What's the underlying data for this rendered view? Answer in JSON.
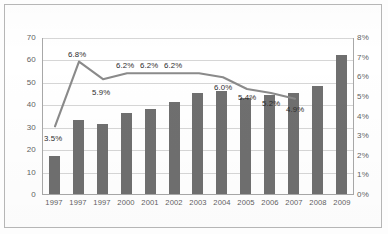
{
  "chart_data": {
    "type": "bar",
    "title": "",
    "subtitle": "",
    "xlabel": "",
    "ylabel": "",
    "grid": true,
    "legend_position": "none",
    "categories": [
      "1997",
      "1997",
      "1997",
      "2000",
      "2001",
      "2002",
      "2003",
      "2004",
      "2005",
      "2006",
      "2007",
      "2008",
      "2009"
    ],
    "series": [
      {
        "name": "bars",
        "chart_type": "bar",
        "axis": "left",
        "color": "#6f6f6f",
        "values": [
          17,
          33,
          31,
          36,
          38,
          41,
          45,
          46,
          43,
          44,
          45,
          48,
          62
        ]
      },
      {
        "name": "percent-line",
        "chart_type": "line",
        "axis": "right",
        "color": "#8a8a8a",
        "values": [
          3.5,
          6.8,
          5.9,
          6.2,
          6.2,
          6.2,
          6.2,
          6.0,
          5.4,
          5.2,
          4.9,
          null,
          null
        ],
        "point_labels": [
          "3.5%",
          "6.8%",
          "5.9%",
          "6.2%",
          "6.2%",
          "6.2%",
          "",
          "6.0%",
          "5.4%",
          "5.2%",
          "4.9%",
          "",
          ""
        ]
      }
    ],
    "left_axis": {
      "min": 0,
      "max": 70,
      "step": 10,
      "ticks": [
        "0",
        "10",
        "20",
        "30",
        "40",
        "50",
        "60",
        "70"
      ]
    },
    "right_axis": {
      "min": 0,
      "max": 8,
      "step": 1,
      "ticks": [
        "0%",
        "1%",
        "2%",
        "3%",
        "4%",
        "5%",
        "6%",
        "7%",
        "8%"
      ]
    }
  },
  "colors": {
    "bar": "#6f6f6f",
    "line": "#8a8a8a",
    "grid": "#d6d6d6",
    "axis": "#a8a8a8",
    "frame": "#b9b9b9",
    "text": "#5f5f5f",
    "label_text": "#2c2c2c"
  }
}
